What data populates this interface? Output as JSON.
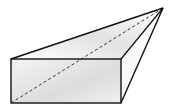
{
  "diagram": {
    "type": "pyramid-with-rectangular-base",
    "points": {
      "apex": [
        163,
        8
      ],
      "front_top_left": [
        11,
        59
      ],
      "front_top_right": [
        121,
        59
      ],
      "front_bottom_left": [
        11,
        103
      ],
      "front_bottom_right": [
        121,
        103
      ]
    },
    "colors": {
      "stroke": "#111111",
      "face_light": "#ffffff",
      "face_shade": "#d9d9d9"
    },
    "labels": []
  }
}
